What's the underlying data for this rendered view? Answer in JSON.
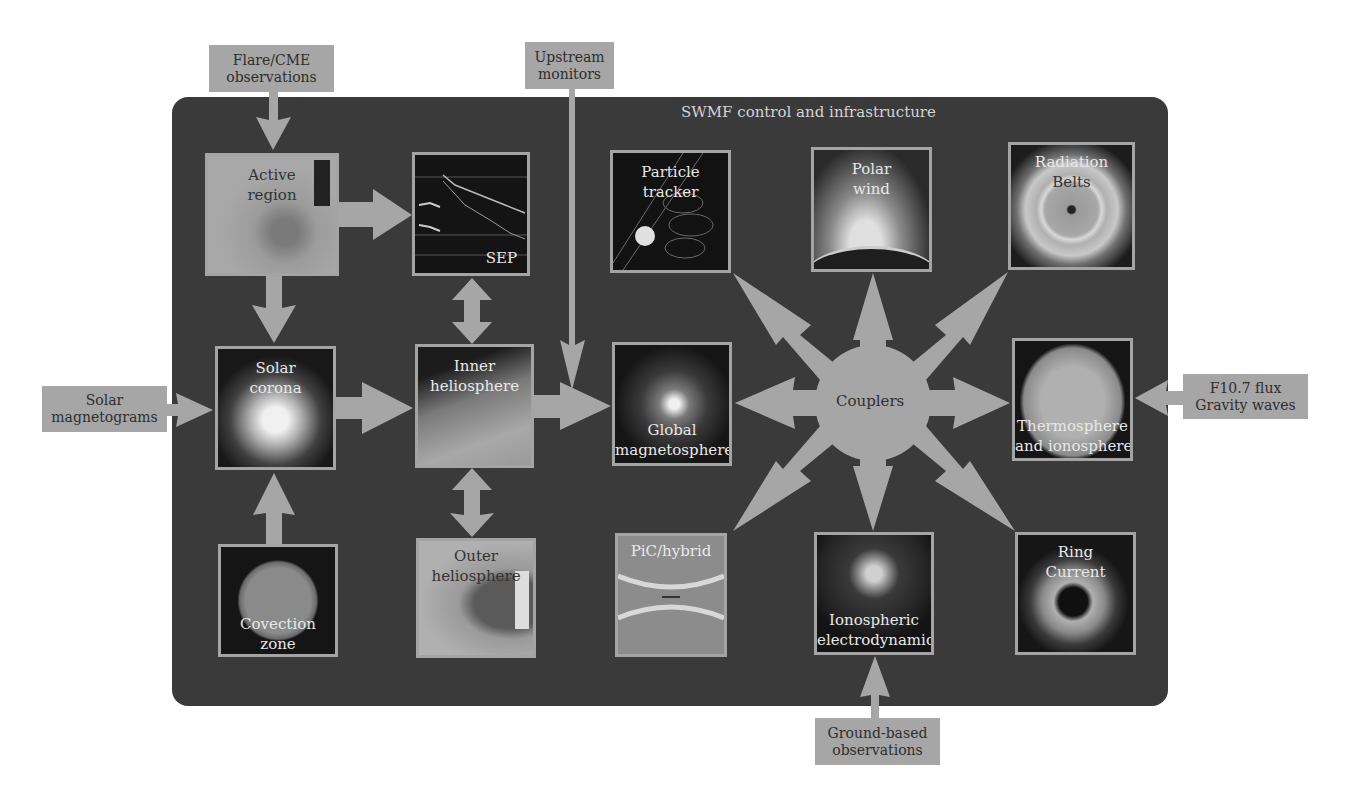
{
  "diagram": {
    "title": "SWMF control and infrastructure",
    "hub": {
      "label": "Couplers"
    },
    "colors": {
      "panel": "#3a3a3a",
      "arrow": "#a6a6a6",
      "box_border": "#a4a4a4",
      "external_box": "#a6a6a6"
    },
    "inputs": [
      {
        "id": "flare",
        "label_lines": [
          "Flare/CME",
          "observations"
        ]
      },
      {
        "id": "upstream",
        "label_lines": [
          "Upstream",
          "monitors"
        ]
      },
      {
        "id": "magnetograms",
        "label_lines": [
          "Solar",
          "magnetograms"
        ]
      },
      {
        "id": "f107",
        "label_lines": [
          "F10.7 flux",
          "Gravity waves"
        ]
      },
      {
        "id": "ground",
        "label_lines": [
          "Ground-based",
          "observations"
        ]
      }
    ],
    "modules": [
      {
        "id": "active-region",
        "label_lines": [
          "Active",
          "region"
        ]
      },
      {
        "id": "sep",
        "label_lines": [
          "SEP"
        ]
      },
      {
        "id": "solar-corona",
        "label_lines": [
          "Solar",
          "corona"
        ]
      },
      {
        "id": "inner-heliosphere",
        "label_lines": [
          "Inner",
          "heliosphere"
        ]
      },
      {
        "id": "convection-zone",
        "label_lines": [
          "Covection",
          "zone"
        ]
      },
      {
        "id": "outer-heliosphere",
        "label_lines": [
          "Outer",
          "heliosphere"
        ]
      },
      {
        "id": "particle-tracker",
        "label_lines": [
          "Particle",
          "tracker"
        ]
      },
      {
        "id": "polar-wind",
        "label_lines": [
          "Polar",
          "wind"
        ]
      },
      {
        "id": "radiation-belts",
        "label_lines": [
          "Radiation",
          "Belts"
        ]
      },
      {
        "id": "global-magnetosphere",
        "label_lines": [
          "Global",
          "magnetosphere"
        ]
      },
      {
        "id": "thermosphere",
        "label_lines": [
          "Thermosphere",
          "and ionosphere"
        ]
      },
      {
        "id": "pic-hybrid",
        "label_lines": [
          "PiC/hybrid"
        ]
      },
      {
        "id": "ionospheric-electrodynamics",
        "label_lines": [
          "Ionospheric",
          "electrodynamics"
        ]
      },
      {
        "id": "ring-current",
        "label_lines": [
          "Ring",
          "Current"
        ]
      }
    ]
  }
}
